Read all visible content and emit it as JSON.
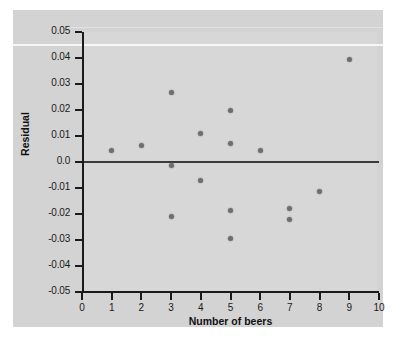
{
  "figure": {
    "background_color": "#d3d3d3",
    "panel_color": "#d7d7d7",
    "marker_color": "#6e6e72",
    "axis_color": "#1a1a1a",
    "zero_line_color": "#3a3a3a"
  },
  "chart_data": {
    "type": "scatter",
    "title": "",
    "xlabel": "Number of beers",
    "ylabel": "Residual",
    "xlim": [
      0,
      10
    ],
    "ylim": [
      -0.05,
      0.05
    ],
    "grid": false,
    "legend": null,
    "reference_lines": [
      {
        "axis": "y",
        "value": 0.0,
        "style": "solid"
      }
    ],
    "xticks": [
      0,
      1,
      2,
      3,
      4,
      5,
      6,
      7,
      8,
      9,
      10
    ],
    "xtick_labels": [
      "0",
      "1",
      "2",
      "3",
      "4",
      "5",
      "6",
      "7",
      "8",
      "9",
      "10"
    ],
    "yticks": [
      0.05,
      0.04,
      0.03,
      0.02,
      0.01,
      0.0,
      -0.01,
      -0.02,
      -0.03,
      -0.04,
      -0.05
    ],
    "ytick_labels": [
      "0.05",
      "0.04",
      "0.03",
      "0.02",
      "0.01",
      "0.0",
      "-0.01",
      "-0.02",
      "-0.03",
      "-0.04",
      "-0.05"
    ],
    "x": [
      1,
      2,
      3,
      3,
      3,
      4,
      4,
      5,
      5,
      5,
      5,
      6,
      7,
      7,
      8,
      9
    ],
    "y": [
      0.0045,
      0.0063,
      0.0268,
      -0.0015,
      -0.021,
      0.011,
      -0.007,
      0.0198,
      0.007,
      -0.0188,
      -0.0293,
      0.0043,
      -0.018,
      -0.0222,
      -0.0115,
      0.0395
    ],
    "points": [
      {
        "x": 1,
        "y": 0.0045
      },
      {
        "x": 2,
        "y": 0.0063
      },
      {
        "x": 3,
        "y": 0.0268
      },
      {
        "x": 3,
        "y": -0.0015
      },
      {
        "x": 3,
        "y": -0.021
      },
      {
        "x": 4,
        "y": 0.011
      },
      {
        "x": 4,
        "y": -0.007
      },
      {
        "x": 5,
        "y": 0.0198
      },
      {
        "x": 5,
        "y": 0.007
      },
      {
        "x": 5,
        "y": -0.0188
      },
      {
        "x": 5,
        "y": -0.0293
      },
      {
        "x": 6,
        "y": 0.0043
      },
      {
        "x": 7,
        "y": -0.018
      },
      {
        "x": 7,
        "y": -0.0222
      },
      {
        "x": 8,
        "y": -0.0115
      },
      {
        "x": 9,
        "y": 0.0395
      }
    ]
  }
}
